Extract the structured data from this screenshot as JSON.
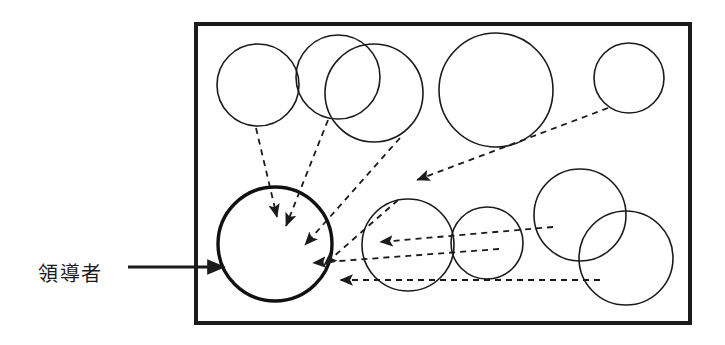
{
  "figure": {
    "type": "diagram",
    "title": "",
    "background_color": "#ffffff",
    "stroke_color": "#1b1b1b",
    "bold_stroke_color": "#111111",
    "canvas": {
      "width": 725,
      "height": 345
    }
  },
  "label": {
    "text": "領導者",
    "meaning": "leader",
    "x": 38,
    "y": 275,
    "font_size": 20,
    "color": "#1b1b1b"
  },
  "label_arrow": {
    "name": "leader-callout-arrow",
    "from_x": 128,
    "from_y": 267,
    "to_x": 224,
    "to_y": 267,
    "stroke_width": 3,
    "style": "solid"
  },
  "boundary": {
    "name": "environment-boundary",
    "x": 196,
    "y": 24,
    "width": 494,
    "height": 299,
    "stroke_width": 4,
    "fill": "none"
  },
  "circles": [
    {
      "id": "agent-1",
      "role": "follower",
      "cx": 258,
      "cy": 85,
      "r": 41,
      "stroke_width": 1.6
    },
    {
      "id": "agent-2",
      "role": "follower",
      "cx": 338,
      "cy": 77,
      "r": 42,
      "stroke_width": 1.6
    },
    {
      "id": "agent-3",
      "role": "follower",
      "cx": 374,
      "cy": 93,
      "r": 49,
      "stroke_width": 1.6
    },
    {
      "id": "agent-4",
      "role": "follower",
      "cx": 496,
      "cy": 90,
      "r": 57,
      "stroke_width": 1.6
    },
    {
      "id": "agent-5",
      "role": "follower",
      "cx": 629,
      "cy": 78,
      "r": 35,
      "stroke_width": 1.6
    },
    {
      "id": "agent-6",
      "role": "follower",
      "cx": 408,
      "cy": 245,
      "r": 46,
      "stroke_width": 1.6
    },
    {
      "id": "agent-7",
      "role": "follower",
      "cx": 487,
      "cy": 243,
      "r": 36,
      "stroke_width": 1.6
    },
    {
      "id": "agent-8",
      "role": "follower",
      "cx": 580,
      "cy": 215,
      "r": 46,
      "stroke_width": 1.6
    },
    {
      "id": "agent-9",
      "role": "follower",
      "cx": 626,
      "cy": 258,
      "r": 47,
      "stroke_width": 1.6
    },
    {
      "id": "agent-leader",
      "role": "leader",
      "cx": 275,
      "cy": 244,
      "r": 57,
      "stroke_width": 3.4
    }
  ],
  "influence_arrows": [
    {
      "id": "arrow-1",
      "from": "agent-1",
      "x1": 256,
      "y1": 128,
      "x2": 277,
      "y2": 217,
      "dash": "6 5"
    },
    {
      "id": "arrow-2",
      "from": "agent-2",
      "x1": 328,
      "y1": 120,
      "x2": 286,
      "y2": 226,
      "dash": "6 5"
    },
    {
      "id": "arrow-3",
      "from": "agent-3",
      "x1": 400,
      "y1": 138,
      "x2": 305,
      "y2": 245,
      "dash": "6 5"
    },
    {
      "id": "arrow-4",
      "from": "agent-6",
      "x1": 398,
      "y1": 200,
      "x2": 324,
      "y2": 265,
      "dash": "6 5"
    },
    {
      "id": "arrow-5",
      "from": "agent-5",
      "x1": 608,
      "y1": 108,
      "x2": 417,
      "y2": 180,
      "dash": "6 5"
    },
    {
      "id": "arrow-6",
      "from": "agent-8",
      "x1": 553,
      "y1": 227,
      "x2": 380,
      "y2": 242,
      "dash": "6 5"
    },
    {
      "id": "arrow-7",
      "from": "agent-7",
      "x1": 499,
      "y1": 249,
      "x2": 313,
      "y2": 263,
      "dash": "6 5"
    },
    {
      "id": "arrow-8",
      "from": "agent-9",
      "x1": 600,
      "y1": 280,
      "x2": 340,
      "y2": 280,
      "dash": "6 5"
    }
  ],
  "annotations": {
    "arrowhead_size": 8,
    "dash_pattern": "6 5"
  }
}
